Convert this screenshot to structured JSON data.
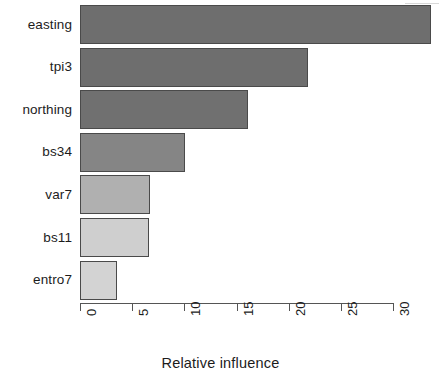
{
  "chart_data": {
    "type": "bar",
    "orientation": "horizontal",
    "title": "",
    "xlabel": "Relative influence",
    "ylabel": "",
    "categories": [
      "easting",
      "tpi3",
      "northing",
      "bs34",
      "var7",
      "bs11",
      "entro7"
    ],
    "values": [
      33.6,
      21.9,
      16.1,
      10.1,
      6.7,
      6.6,
      3.5
    ],
    "bar_colors": [
      "#6e6e6e",
      "#6e6e6e",
      "#707070",
      "#858585",
      "#b0b0b0",
      "#cfcfcf",
      "#d3d3d3"
    ],
    "bar_border_color": "#4a4a4a",
    "xlim": [
      0,
      33.8
    ],
    "xticks": [
      0,
      5,
      10,
      15,
      20,
      25,
      30
    ],
    "xtick_labels": [
      "0",
      "5",
      "10",
      "15",
      "20",
      "25",
      "30"
    ],
    "xtick_rotation": 90,
    "grid": false,
    "legend": false,
    "axis_color": "#555555",
    "background": "#ffffff"
  },
  "axis": {
    "x_title": "Relative influence"
  }
}
